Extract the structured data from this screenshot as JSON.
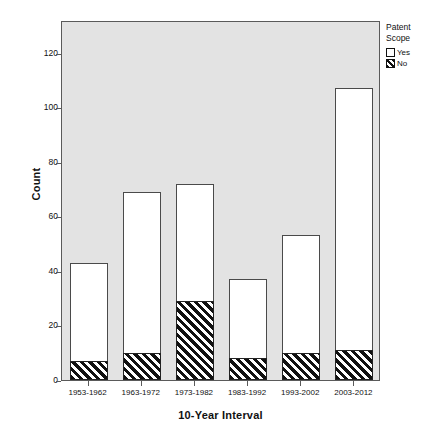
{
  "chart_data": {
    "type": "bar",
    "title": "",
    "xlabel": "10-Year Interval",
    "ylabel": "Count",
    "categories": [
      "1953-1962",
      "1963-1972",
      "1973-1982",
      "1983-1992",
      "1993-2002",
      "2003-2012"
    ],
    "series": [
      {
        "name": "Yes",
        "values": [
          36,
          59,
          43,
          29,
          43,
          96
        ]
      },
      {
        "name": "No",
        "values": [
          7,
          10,
          29,
          8,
          10,
          11
        ]
      }
    ],
    "totals": [
      43,
      69,
      72,
      37,
      53,
      107
    ],
    "stacked": true,
    "ylim": [
      0,
      132
    ],
    "yticks": [
      0,
      20,
      40,
      60,
      80,
      100,
      120
    ],
    "ytick_labels": [
      "0",
      "20",
      "40",
      "60",
      "80",
      "100",
      "120"
    ],
    "grid": false,
    "legend": {
      "title_line1": "Patent",
      "title_line2": "Scope",
      "position": "right-top",
      "entries": [
        {
          "label": "Yes",
          "swatch": "white-square-icon"
        },
        {
          "label": "No",
          "swatch": "hatched-square-icon"
        }
      ]
    },
    "colors": {
      "plot_background": "#e3e3e3",
      "frame": "#5a5a5a",
      "bar_yes_fill": "#ffffff",
      "bar_outline": "#4a4a4a",
      "bar_no_hatch": "#111111",
      "text": "#111111",
      "page_background": "#ffffff"
    }
  },
  "caption": {
    "remnant_text": ""
  }
}
